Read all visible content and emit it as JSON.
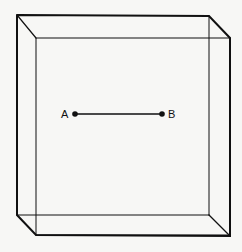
{
  "diagram": {
    "title": "",
    "points": [
      {
        "label": "A",
        "x": 75,
        "y": 114
      },
      {
        "label": "B",
        "x": 162,
        "y": 114
      }
    ],
    "colors": {
      "line": "#111111",
      "background": "#f7f7f5"
    }
  }
}
